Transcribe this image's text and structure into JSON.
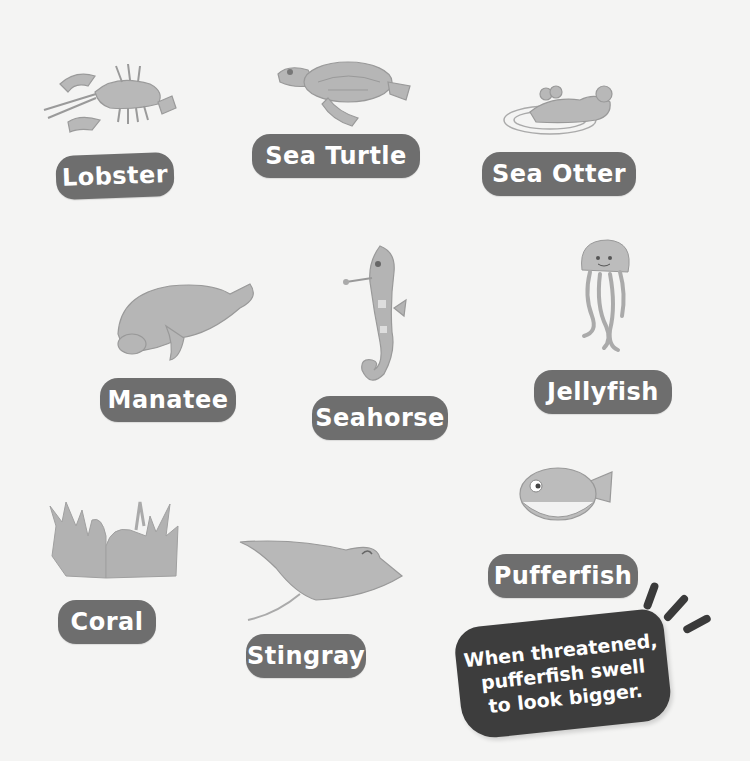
{
  "animals": [
    {
      "id": "lobster",
      "label": "Lobster",
      "icon": "lobster-illustration"
    },
    {
      "id": "sea-turtle",
      "label": "Sea Turtle",
      "icon": "sea-turtle-illustration"
    },
    {
      "id": "sea-otter",
      "label": "Sea Otter",
      "icon": "sea-otter-illustration"
    },
    {
      "id": "manatee",
      "label": "Manatee",
      "icon": "manatee-illustration"
    },
    {
      "id": "seahorse",
      "label": "Seahorse",
      "icon": "seahorse-illustration"
    },
    {
      "id": "jellyfish",
      "label": "Jellyfish",
      "icon": "jellyfish-illustration"
    },
    {
      "id": "coral",
      "label": "Coral",
      "icon": "coral-illustration"
    },
    {
      "id": "stingray",
      "label": "Stingray",
      "icon": "stingray-illustration"
    },
    {
      "id": "pufferfish",
      "label": "Pufferfish",
      "icon": "pufferfish-illustration"
    }
  ],
  "fact_bubble": {
    "lines": [
      "When threatened,",
      "pufferfish swell",
      "to look bigger."
    ]
  },
  "colors": {
    "label_bg": "#6e6e6e",
    "label_text": "#ffffff",
    "bubble_bg": "#3d3d3d",
    "page_bg": "#f4f4f3",
    "art_fill": "#b4b4b4"
  }
}
